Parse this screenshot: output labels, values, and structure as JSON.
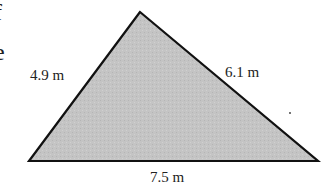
{
  "diagram": {
    "shape": "triangle",
    "fill_color": "#c2c2c2",
    "stroke_color": "#111111",
    "vertices": {
      "apex": [
        140,
        12
      ],
      "bottom_left": [
        29,
        161
      ],
      "bottom_right": [
        318,
        161
      ]
    },
    "sides": {
      "left": {
        "label": "4.9 m"
      },
      "right": {
        "label": "6.1 m"
      },
      "bottom": {
        "label": "7.5 m"
      }
    },
    "edge_fragments": [
      "f",
      "e"
    ]
  }
}
